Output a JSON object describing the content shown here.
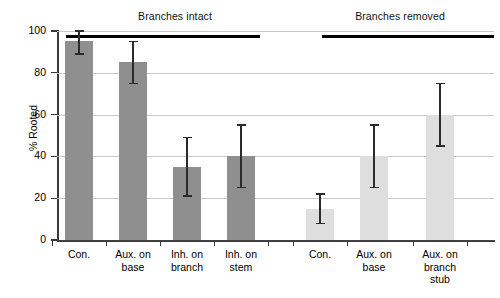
{
  "chart_data": {
    "type": "bar",
    "title": "",
    "xlabel": "",
    "ylabel": "% Rooted",
    "ylim": [
      0,
      100
    ],
    "yticks": [
      0,
      20,
      40,
      60,
      80,
      100
    ],
    "ytick_labels": [
      "0",
      "20",
      "40",
      "60",
      "80",
      "100"
    ],
    "grid": true,
    "legend": "none",
    "categories": [
      "Con.",
      "Aux. on base",
      "Inh. on branch",
      "Inh. on stem",
      "Con.",
      "Aux. on base",
      "Aux. on branch stub"
    ],
    "values": [
      95,
      85,
      35,
      40,
      15,
      40,
      60
    ],
    "errors_upper": [
      5,
      10,
      14,
      15,
      7,
      15,
      15
    ],
    "errors_lower": [
      6,
      10,
      14,
      15,
      7,
      15,
      15
    ],
    "bar_colors": [
      "#8f8f8f",
      "#8f8f8f",
      "#8f8f8f",
      "#8f8f8f",
      "#dedede",
      "#dedede",
      "#dedede"
    ],
    "groups": [
      {
        "label": "Branches intact",
        "members": [
          0,
          1,
          2,
          3
        ]
      },
      {
        "label": "Branches removed",
        "members": [
          4,
          5,
          6
        ]
      }
    ],
    "annotations": [
      {
        "name": "group-span-left",
        "label": "Branches intact"
      },
      {
        "name": "group-span-right",
        "label": "Branches removed"
      }
    ]
  },
  "axis": {
    "y_label": "% Rooted",
    "y_ticks": [
      "100",
      "80",
      "60",
      "40",
      "20",
      "0"
    ]
  },
  "groups": {
    "left_title": "Branches intact",
    "right_title": "Branches removed"
  },
  "x_labels": [
    "Con.",
    "Aux. on\nbase",
    "Inh. on\nbranch",
    "Inh. on\nstem",
    "Con.",
    "Aux. on\nbase",
    "Aux. on\nbranch\nstub"
  ]
}
